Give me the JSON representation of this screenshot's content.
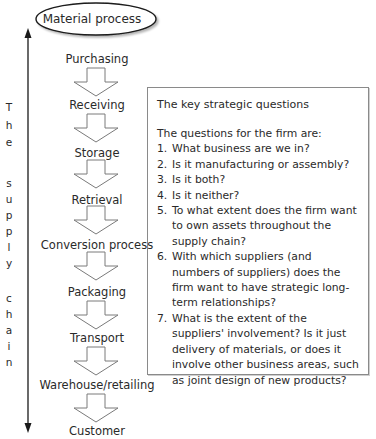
{
  "title": "Material process",
  "side_label": {
    "words": [
      "The",
      "supply",
      "chain"
    ],
    "letters": [
      "T",
      "h",
      "e",
      "",
      "s",
      "u",
      "p",
      "p",
      "l",
      "y",
      "",
      "c",
      "h",
      "a",
      "i",
      "n"
    ]
  },
  "steps": [
    {
      "label": "Purchasing"
    },
    {
      "label": "Receiving"
    },
    {
      "label": "Storage"
    },
    {
      "label": "Retrieval"
    },
    {
      "label": "Conversion process"
    },
    {
      "label": "Packaging"
    },
    {
      "label": "Transport"
    },
    {
      "label": "Warehouse/retailing"
    },
    {
      "label": "Customer"
    }
  ],
  "questions_box": {
    "heading": "The key strategic questions",
    "intro": "The questions for the firm are:",
    "items": [
      {
        "num": "1.",
        "text": "What business are we in?"
      },
      {
        "num": "2.",
        "text": "Is it manufacturing or assembly?"
      },
      {
        "num": "3.",
        "text": "Is it both?"
      },
      {
        "num": "4.",
        "text": "Is it neither?"
      },
      {
        "num": "5.",
        "text": "To what extent does the firm want to own assets throughout the supply chain?"
      },
      {
        "num": "6.",
        "text": "With which suppliers (and numbers of suppliers) does the firm want to have strategic long-term relationships?"
      },
      {
        "num": "7.",
        "text": "What is the extent of the suppliers' involvement? Is it just delivery of materials, or does it involve other business areas, such as joint design of new products?"
      }
    ]
  },
  "colors": {
    "line": "#1a1a1a",
    "arrow_stroke": "#7a7a7a",
    "box_border": "#8a8a8a",
    "text": "#2a2a2a"
  }
}
